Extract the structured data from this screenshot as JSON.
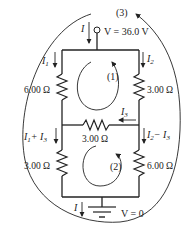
{
  "diagram": {
    "type": "circuit",
    "source": {
      "label": "V = 36.0 V",
      "current": "I"
    },
    "ground": {
      "label": "V = 0",
      "current": "I"
    },
    "resistors": {
      "top_left": "6.00 Ω",
      "top_right": "3.00 Ω",
      "middle": "3.00 Ω",
      "bottom_left": "3.00 Ω",
      "bottom_right": "6.00 Ω"
    },
    "currents": {
      "i1": "I",
      "i1_sub": "1",
      "i2": "I",
      "i2_sub": "2",
      "i3": "I",
      "i3_sub": "3",
      "bottom_left_a": "I",
      "bottom_left_a_sub": "1",
      "bottom_left_plus": "+ I",
      "bottom_left_b_sub": "3",
      "bottom_right_a": "I",
      "bottom_right_a_sub": "2",
      "bottom_right_minus": "− I",
      "bottom_right_b_sub": "3"
    },
    "loops": {
      "loop1": "(1)",
      "loop2": "(2)",
      "loop3": "(3)"
    }
  },
  "colors": {
    "ink": "#222222",
    "background": "#ffffff"
  }
}
